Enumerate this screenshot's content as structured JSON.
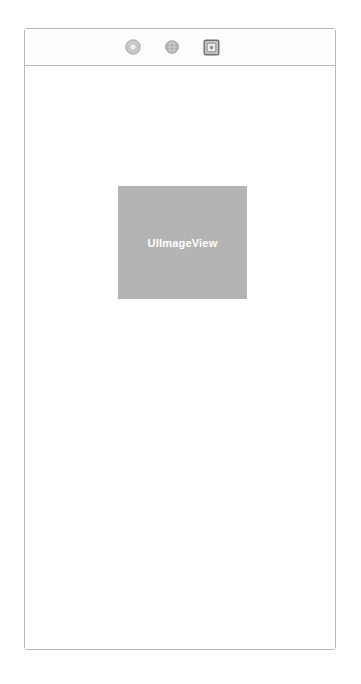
{
  "window": {
    "frame_label": "device-frame",
    "border_color": "#b9b9b9",
    "background_color": "#ffffff"
  },
  "toolbar": {
    "background_color": "#fefefe",
    "items": [
      {
        "icon": "donut-ring-icon",
        "label": "",
        "color": "#a8a8a8"
      },
      {
        "icon": "globe-icon",
        "label": "",
        "color": "#8f8f8f"
      },
      {
        "icon": "image-frame-icon",
        "label": "",
        "color": "#6e6e6e"
      }
    ]
  },
  "canvas": {
    "background_color": "#ffffff",
    "image_view": {
      "label": "UIImageView",
      "fill_color": "#b4b4b4",
      "text_color": "#ffffff",
      "width": 129,
      "height": 113
    }
  }
}
